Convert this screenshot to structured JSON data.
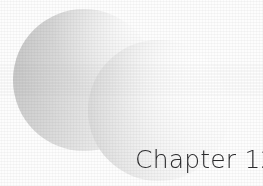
{
  "page": {
    "kind": "chapter-divider",
    "background_color": "#fdfdfd"
  },
  "title": {
    "text": "Chapter 12",
    "chapter_word": "Chapter",
    "chapter_number": "12",
    "color": "#2b2b2d"
  },
  "decoration": {
    "shapes": [
      {
        "name": "back-circle",
        "shape": "circle",
        "fill_start": "#c2c2c2",
        "fill_end": "#f6f6f6"
      },
      {
        "name": "front-circle",
        "shape": "circle",
        "fill_start": "#d2d2d2",
        "fill_end": "#fbfbfb"
      }
    ]
  }
}
